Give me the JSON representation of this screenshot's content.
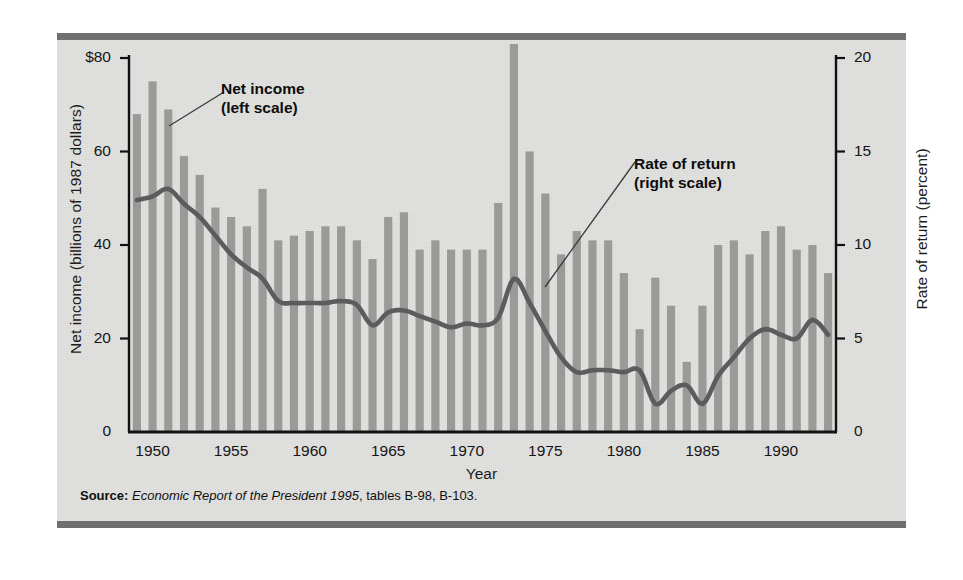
{
  "figure": {
    "source_prefix": "Source:",
    "source_italic": "Economic Report of the President 1995",
    "source_tail": ", tables B-98, B-103."
  },
  "annotations": {
    "net_income_line1": "Net income",
    "net_income_line2": "(left scale)",
    "rate_of_return_line1": "Rate of return",
    "rate_of_return_line2": "(right scale)"
  },
  "chart_data": {
    "type": "bar",
    "title": "",
    "xlabel": "Year",
    "ylabel": "Net income (billions of 1987 dollars)",
    "y2label": "Rate of return (percent)",
    "xlim": [
      1948.5,
      1993.5
    ],
    "ylim": [
      0,
      80
    ],
    "y2lim": [
      0,
      20
    ],
    "grid": false,
    "legend": "inline-annotations",
    "bar_color": "#9a9a98",
    "line_color": "#5c5c5c",
    "xticks": [
      1950,
      1955,
      1960,
      1965,
      1970,
      1975,
      1980,
      1985,
      1990
    ],
    "xtick_labels": [
      "1950",
      "1955",
      "1960",
      "1965",
      "1970",
      "1975",
      "1980",
      "1985",
      "1990"
    ],
    "yticks": [
      0,
      20,
      40,
      60,
      80
    ],
    "ytick_labels": [
      "0",
      "20",
      "40",
      "60",
      "$80"
    ],
    "y2ticks": [
      0,
      5,
      10,
      15,
      20
    ],
    "y2tick_labels": [
      "0",
      "5",
      "10",
      "15",
      "20"
    ],
    "x": [
      1949,
      1950,
      1951,
      1952,
      1953,
      1954,
      1955,
      1956,
      1957,
      1958,
      1959,
      1960,
      1961,
      1962,
      1963,
      1964,
      1965,
      1966,
      1967,
      1968,
      1969,
      1970,
      1971,
      1972,
      1973,
      1974,
      1975,
      1976,
      1977,
      1978,
      1979,
      1980,
      1981,
      1982,
      1983,
      1984,
      1985,
      1986,
      1987,
      1988,
      1989,
      1990,
      1991,
      1992,
      1993
    ],
    "series": [
      {
        "name": "Net income (left scale)",
        "type": "bar",
        "axis": "left",
        "unit": "billions of 1987 dollars",
        "values": [
          68,
          75,
          69,
          59,
          55,
          48,
          46,
          44,
          52,
          41,
          42,
          43,
          44,
          44,
          41,
          37,
          46,
          47,
          39,
          41,
          39,
          39,
          39,
          49,
          83,
          60,
          51,
          38,
          43,
          41,
          41,
          34,
          22,
          33,
          27,
          15,
          27,
          40,
          41,
          38,
          43,
          44,
          39,
          40,
          34
        ]
      },
      {
        "name": "Rate of return (right scale)",
        "type": "line",
        "axis": "right",
        "unit": "percent",
        "values": [
          12.4,
          12.6,
          13.0,
          12.2,
          11.5,
          10.5,
          9.5,
          8.8,
          8.2,
          7.0,
          6.9,
          6.9,
          6.9,
          7.0,
          6.8,
          5.7,
          6.4,
          6.5,
          6.2,
          5.9,
          5.6,
          5.8,
          5.7,
          6.1,
          8.2,
          6.9,
          5.4,
          4.0,
          3.2,
          3.3,
          3.3,
          3.2,
          3.3,
          1.5,
          2.2,
          2.5,
          1.5,
          3.0,
          4.0,
          5.0,
          5.5,
          5.2,
          5.0,
          6.0,
          5.2
        ]
      }
    ]
  }
}
